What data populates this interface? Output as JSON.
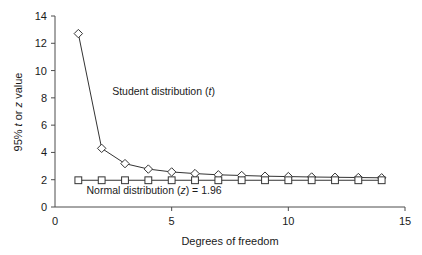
{
  "chart_data": {
    "type": "line",
    "title": "",
    "xlabel": "Degrees of freedom",
    "ylabel": "95% t or z value",
    "ylabel_parts": [
      {
        "text": "95% ",
        "italic": false
      },
      {
        "text": "t",
        "italic": true
      },
      {
        "text": " or ",
        "italic": false
      },
      {
        "text": "z",
        "italic": true
      },
      {
        "text": " value",
        "italic": false
      }
    ],
    "xlim": [
      0,
      15
    ],
    "ylim": [
      0,
      14
    ],
    "xticks": [
      0,
      5,
      10,
      15
    ],
    "xtick_labels": [
      "0",
      "5",
      "10",
      "15"
    ],
    "yticks": [
      0,
      2,
      4,
      6,
      8,
      10,
      12,
      14
    ],
    "ytick_labels": [
      "0",
      "2",
      "4",
      "6",
      "8",
      "10",
      "12",
      "14"
    ],
    "grid": false,
    "legend_position": "inline-annotation",
    "x": [
      1,
      2,
      3,
      4,
      5,
      6,
      7,
      8,
      9,
      10,
      11,
      12,
      13,
      14
    ],
    "series": [
      {
        "name": "Student distribution (t)",
        "marker": "diamond",
        "values": [
          12.71,
          4.3,
          3.18,
          2.78,
          2.57,
          2.45,
          2.36,
          2.31,
          2.26,
          2.23,
          2.2,
          2.18,
          2.16,
          2.14
        ]
      },
      {
        "name": "Normal distribution (z) = 1.96",
        "marker": "square",
        "values": [
          1.96,
          1.96,
          1.96,
          1.96,
          1.96,
          1.96,
          1.96,
          1.96,
          1.96,
          1.96,
          1.96,
          1.96,
          1.96,
          1.96
        ]
      }
    ],
    "annotations": [
      {
        "id": "student-annotation",
        "parts": [
          {
            "text": "Student distribution (",
            "italic": false
          },
          {
            "text": "t",
            "italic": true
          },
          {
            "text": ")",
            "italic": false
          }
        ],
        "plain": "Student distribution (t)",
        "x": 2.45,
        "y": 8.2
      },
      {
        "id": "normal-annotation",
        "parts": [
          {
            "text": "Normal distribution (",
            "italic": false
          },
          {
            "text": "z",
            "italic": true
          },
          {
            "text": ") = 1.96",
            "italic": false
          }
        ],
        "plain": "Normal distribution (z) = 1.96",
        "x": 1.35,
        "y": 0.95
      }
    ],
    "colors": {
      "background": "#ffffff",
      "axis": "#4d4d4d",
      "line": "#333333",
      "marker_fill": "#ffffff",
      "text": "#1a1a1a"
    }
  }
}
